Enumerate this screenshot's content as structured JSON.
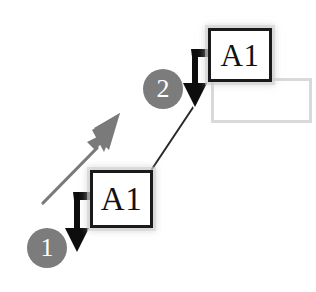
{
  "diagram": {
    "background_color": "#ffffff",
    "accent_gray": "#7c7c7c",
    "stroke_black": "#1a1a1a",
    "placeholder_border": "#d9d9d9"
  },
  "cells": [
    {
      "id": "cell-lower",
      "name": "cell-box-lower",
      "label": "A1",
      "x": 90,
      "y": 170,
      "width": 63,
      "height": 58
    },
    {
      "id": "cell-upper",
      "name": "cell-box-upper",
      "label": "A1",
      "x": 208,
      "y": 28,
      "width": 64,
      "height": 54
    }
  ],
  "placeholder": {
    "name": "empty-target-rectangle",
    "label": "",
    "x": 211,
    "y": 78,
    "width": 101,
    "height": 45
  },
  "steps": [
    {
      "number": "1",
      "x": 27,
      "y": 228
    },
    {
      "number": "2",
      "x": 143,
      "y": 69
    }
  ],
  "pointers": [
    {
      "name": "fill-handle-cursor-1",
      "target_cell": "cell-lower"
    },
    {
      "name": "fill-handle-cursor-2",
      "target_cell": "cell-upper"
    }
  ],
  "connectors": [
    {
      "name": "drag-direction-arrow",
      "style": "solid-gray",
      "direction": "up-right"
    },
    {
      "name": "step-link-line",
      "style": "thin-dark",
      "from": "cell-lower",
      "to": "cell-upper"
    }
  ]
}
